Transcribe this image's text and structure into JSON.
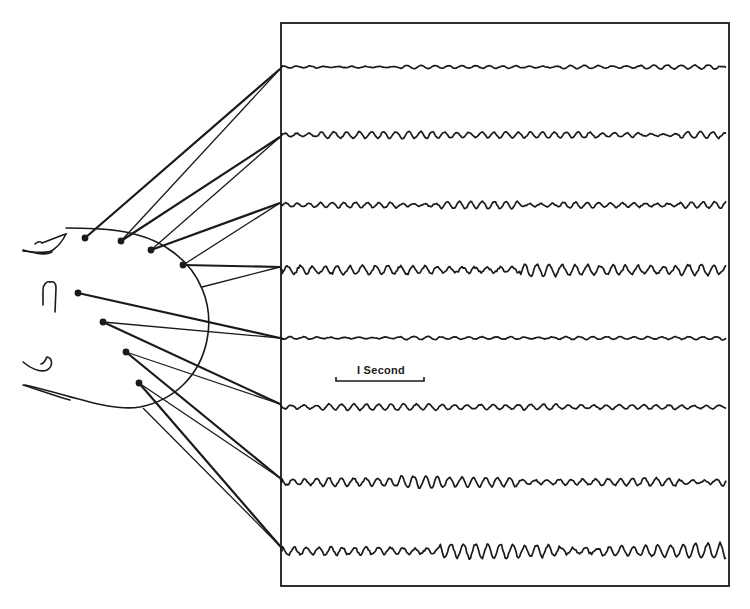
{
  "figure": {
    "type": "EEG electrode montage diagram",
    "ink_color": "#1a1a1a",
    "background": "#ffffff",
    "scale_bar": {
      "label": "I Second",
      "x1": 336,
      "x2": 424,
      "y": 381
    },
    "record_frame": {
      "x": 281,
      "y": 23,
      "width": 448,
      "height": 563
    }
  },
  "head": {
    "circle": {
      "cx": 120,
      "cy": 320,
      "rx": 90,
      "ry": 90
    },
    "electrodes": [
      {
        "id": "E1",
        "x": 85,
        "y": 238
      },
      {
        "id": "E2",
        "x": 121,
        "y": 241
      },
      {
        "id": "E3",
        "x": 151,
        "y": 250
      },
      {
        "id": "E4",
        "x": 183,
        "y": 265
      },
      {
        "id": "E5",
        "x": 78,
        "y": 293
      },
      {
        "id": "E6",
        "x": 103,
        "y": 322
      },
      {
        "id": "E7",
        "x": 126,
        "y": 352
      },
      {
        "id": "E8",
        "x": 139,
        "y": 383
      }
    ]
  },
  "channels": [
    {
      "index": 1,
      "baseline_y": 67,
      "attach_y": 69,
      "amp": 1.6,
      "freq": 0.55,
      "activity": "low"
    },
    {
      "index": 2,
      "baseline_y": 135,
      "attach_y": 137,
      "amp": 3.0,
      "freq": 0.62,
      "activity": "medium"
    },
    {
      "index": 3,
      "baseline_y": 205,
      "attach_y": 203,
      "amp": 3.2,
      "freq": 0.65,
      "activity": "medium"
    },
    {
      "index": 4,
      "baseline_y": 270,
      "attach_y": 267,
      "amp": 6.5,
      "freq": 0.6,
      "activity": "high"
    },
    {
      "index": 5,
      "baseline_y": 338,
      "attach_y": 338,
      "amp": 2.0,
      "freq": 0.55,
      "activity": "low"
    },
    {
      "index": 6,
      "baseline_y": 407,
      "attach_y": 404,
      "amp": 3.0,
      "freq": 0.6,
      "activity": "medium"
    },
    {
      "index": 7,
      "baseline_y": 482,
      "attach_y": 478,
      "amp": 5.0,
      "freq": 0.62,
      "activity": "high"
    },
    {
      "index": 8,
      "baseline_y": 551,
      "attach_y": 546,
      "amp": 6.5,
      "freq": 0.62,
      "activity": "high"
    }
  ],
  "leads": [
    {
      "from": "E1",
      "to_channel": 1,
      "weight": "thick"
    },
    {
      "from": "E2",
      "to_channel": 1,
      "weight": "thin"
    },
    {
      "from": "E2",
      "to_channel": 2,
      "weight": "thick"
    },
    {
      "from": "E3",
      "to_channel": 2,
      "weight": "thin"
    },
    {
      "from": "E3",
      "to_channel": 3,
      "weight": "thick"
    },
    {
      "from": "E4",
      "to_channel": 3,
      "weight": "thin"
    },
    {
      "from": "E4",
      "to_channel": 4,
      "weight": "thick"
    },
    {
      "from": "REF_R",
      "to_channel": 4,
      "weight": "thin"
    },
    {
      "from": "E5",
      "to_channel": 5,
      "weight": "thick"
    },
    {
      "from": "E6",
      "to_channel": 5,
      "weight": "thin"
    },
    {
      "from": "E6",
      "to_channel": 6,
      "weight": "thick"
    },
    {
      "from": "E7",
      "to_channel": 6,
      "weight": "thin"
    },
    {
      "from": "E7",
      "to_channel": 7,
      "weight": "thick"
    },
    {
      "from": "E8",
      "to_channel": 7,
      "weight": "thin"
    },
    {
      "from": "E8",
      "to_channel": 8,
      "weight": "thick"
    },
    {
      "from": "REF_B",
      "to_channel": 8,
      "weight": "thin"
    }
  ],
  "reference_points": {
    "REF_R": {
      "x": 202,
      "y": 287
    },
    "REF_B": {
      "x": 143,
      "y": 408
    }
  }
}
